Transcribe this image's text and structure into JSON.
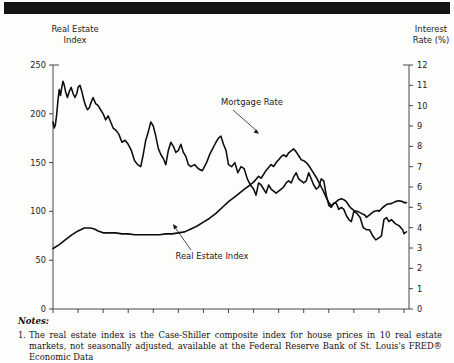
{
  "figure": {
    "left_axis_title_line1": "Real Estate",
    "left_axis_title_line2": "Index",
    "right_axis_title_line1": "Interest",
    "right_axis_title_line2": "Rate (%)",
    "annotation_mortgage": "Mortgage Rate",
    "annotation_index": "Real Estate Index"
  },
  "notes": {
    "heading": "Notes:",
    "items": [
      {
        "number": "1.",
        "text": "The real estate index is the Case-Shiller composite index for house prices in 10 real estate markets, not seasonally adjusted, available at the Federal Reserve Bank of St. Louis's FRED® Economic Data"
      }
    ]
  },
  "chart_data": {
    "type": "line",
    "title": "",
    "xlabel": "",
    "ylabel": "Real Estate Index",
    "y2label": "Interest Rate (%)",
    "xlim": [
      1987,
      2015.4
    ],
    "ylim": [
      0,
      250
    ],
    "y2lim": [
      0,
      12
    ],
    "yticks": [
      0,
      50,
      100,
      150,
      200,
      250
    ],
    "y2ticks": [
      0,
      1,
      2,
      3,
      4,
      5,
      6,
      7,
      8,
      9,
      10,
      11,
      12
    ],
    "xticks": [
      1987,
      1989,
      1991,
      1993,
      1995,
      1997,
      1999,
      2001,
      2003,
      2005,
      2007,
      2009,
      2011,
      2013,
      2015
    ],
    "grid": false,
    "legend": "annotations",
    "series": [
      {
        "name": "Mortgage Rate",
        "axis": "right",
        "units": "percent",
        "x": [
          1987.0,
          1987.1,
          1987.2,
          1987.3,
          1987.4,
          1987.5,
          1987.6,
          1987.7,
          1987.8,
          1987.9,
          1988.0,
          1988.15,
          1988.3,
          1988.45,
          1988.6,
          1988.75,
          1988.9,
          1989.0,
          1989.15,
          1989.3,
          1989.45,
          1989.6,
          1989.75,
          1989.9,
          1990.0,
          1990.2,
          1990.4,
          1990.6,
          1990.8,
          1991.0,
          1991.2,
          1991.4,
          1991.6,
          1991.8,
          1992.0,
          1992.25,
          1992.5,
          1992.75,
          1993.0,
          1993.25,
          1993.5,
          1993.75,
          1994.0,
          1994.2,
          1994.4,
          1994.6,
          1994.8,
          1995.0,
          1995.2,
          1995.4,
          1995.6,
          1995.8,
          1996.0,
          1996.2,
          1996.4,
          1996.6,
          1996.8,
          1997.0,
          1997.2,
          1997.4,
          1997.6,
          1997.8,
          1998.0,
          1998.3,
          1998.6,
          1998.9,
          1999.0,
          1999.25,
          1999.5,
          1999.75,
          2000.0,
          2000.2,
          2000.4,
          2000.6,
          2000.8,
          2001.0,
          2001.25,
          2001.5,
          2001.75,
          2002.0,
          2002.25,
          2002.5,
          2002.75,
          2003.0,
          2003.2,
          2003.4,
          2003.6,
          2003.8,
          2004.0,
          2004.2,
          2004.4,
          2004.6,
          2004.8,
          2005.0,
          2005.2,
          2005.4,
          2005.6,
          2005.8,
          2006.0,
          2006.2,
          2006.4,
          2006.6,
          2006.8,
          2007.0,
          2007.2,
          2007.4,
          2007.6,
          2007.8,
          2008.0,
          2008.2,
          2008.4,
          2008.6,
          2008.8,
          2009.0,
          2009.2,
          2009.4,
          2009.6,
          2009.8,
          2010.0,
          2010.2,
          2010.4,
          2010.6,
          2010.8,
          2011.0,
          2011.25,
          2011.5,
          2011.75,
          2012.0,
          2012.25,
          2012.5,
          2012.75,
          2013.0,
          2013.2,
          2013.4,
          2013.6,
          2013.8,
          2014.0,
          2014.3,
          2014.6,
          2014.9,
          2015.0,
          2015.2
        ],
        "y": [
          9.2,
          8.9,
          9.1,
          9.6,
          10.3,
          10.8,
          10.5,
          10.9,
          11.2,
          11.0,
          10.7,
          10.4,
          10.7,
          10.9,
          10.6,
          10.4,
          10.6,
          10.9,
          11.0,
          10.7,
          10.3,
          10.0,
          9.8,
          9.9,
          10.1,
          10.4,
          10.1,
          10.0,
          9.8,
          9.6,
          9.3,
          9.5,
          9.2,
          8.9,
          8.8,
          8.6,
          8.2,
          8.3,
          8.1,
          7.8,
          7.3,
          7.1,
          7.0,
          7.6,
          8.3,
          8.7,
          9.2,
          9.0,
          8.5,
          7.9,
          7.6,
          7.4,
          7.1,
          7.8,
          8.2,
          8.0,
          7.7,
          7.8,
          8.1,
          7.7,
          7.5,
          7.1,
          7.0,
          7.1,
          6.9,
          6.8,
          6.9,
          7.2,
          7.6,
          7.9,
          8.2,
          8.4,
          8.5,
          8.1,
          7.8,
          7.1,
          7.0,
          7.2,
          6.7,
          7.0,
          6.9,
          6.4,
          6.1,
          5.9,
          5.6,
          6.2,
          6.1,
          5.9,
          5.7,
          6.1,
          5.9,
          5.8,
          5.7,
          5.8,
          5.9,
          6.0,
          6.2,
          6.3,
          6.2,
          6.5,
          6.7,
          6.4,
          6.3,
          6.2,
          6.3,
          6.7,
          6.4,
          6.1,
          5.9,
          6.0,
          6.4,
          6.3,
          5.6,
          5.1,
          5.0,
          5.2,
          5.2,
          4.9,
          5.0,
          4.9,
          4.6,
          4.4,
          4.3,
          4.8,
          4.7,
          4.5,
          4.0,
          3.9,
          3.9,
          3.6,
          3.4,
          3.5,
          3.6,
          4.4,
          4.5,
          4.3,
          4.4,
          4.2,
          4.1,
          3.9,
          3.7,
          3.8
        ]
      },
      {
        "name": "Real Estate Index",
        "axis": "left",
        "units": "index",
        "x": [
          1987.0,
          1987.5,
          1988.0,
          1988.5,
          1989.0,
          1989.5,
          1990.0,
          1990.3,
          1990.6,
          1991.0,
          1991.5,
          1992.0,
          1992.5,
          1993.0,
          1993.5,
          1994.0,
          1994.5,
          1995.0,
          1995.5,
          1996.0,
          1996.5,
          1997.0,
          1997.5,
          1998.0,
          1998.5,
          1999.0,
          1999.5,
          2000.0,
          2000.5,
          2001.0,
          2001.5,
          2002.0,
          2002.3,
          2002.6,
          2003.0,
          2003.2,
          2003.4,
          2003.6,
          2003.8,
          2004.0,
          2004.2,
          2004.4,
          2004.6,
          2004.8,
          2005.0,
          2005.2,
          2005.4,
          2005.6,
          2005.8,
          2006.0,
          2006.2,
          2006.4,
          2006.6,
          2006.8,
          2007.0,
          2007.2,
          2007.4,
          2007.6,
          2007.8,
          2008.0,
          2008.2,
          2008.4,
          2008.6,
          2008.8,
          2009.0,
          2009.2,
          2009.4,
          2009.6,
          2009.8,
          2010.0,
          2010.2,
          2010.4,
          2010.6,
          2010.8,
          2011.0,
          2011.3,
          2011.6,
          2011.9,
          2012.0,
          2012.3,
          2012.6,
          2012.9,
          2013.0,
          2013.3,
          2013.6,
          2013.9,
          2014.0,
          2014.3,
          2014.6,
          2014.9,
          2015.0,
          2015.2
        ],
        "y": [
          62,
          66,
          71,
          76,
          80,
          83,
          83,
          82,
          80,
          78,
          78,
          78,
          77,
          77,
          76,
          76,
          76,
          76,
          76,
          77,
          77,
          78,
          79,
          82,
          85,
          89,
          93,
          98,
          104,
          110,
          115,
          120,
          123,
          126,
          130,
          133,
          136,
          134,
          138,
          142,
          145,
          148,
          146,
          150,
          153,
          156,
          158,
          156,
          160,
          162,
          164,
          161,
          157,
          153,
          152,
          150,
          147,
          143,
          139,
          135,
          130,
          125,
          120,
          114,
          109,
          106,
          108,
          110,
          112,
          113,
          112,
          110,
          106,
          103,
          101,
          100,
          98,
          96,
          94,
          97,
          100,
          101,
          100,
          104,
          107,
          108,
          108,
          110,
          111,
          110,
          109,
          109
        ]
      }
    ]
  }
}
